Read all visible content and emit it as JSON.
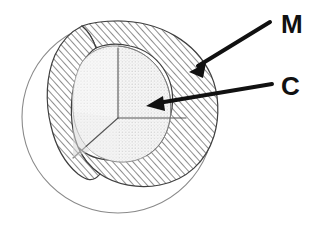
{
  "figure": {
    "type": "cutaway-cross-section",
    "background_color": "#ffffff",
    "canvas": {
      "width": 316,
      "height": 230
    }
  },
  "sphere": {
    "center": {
      "x": 118,
      "y": 117
    },
    "outer_radius": 96,
    "outline_color": "#8a8a8a",
    "outline_width": 1,
    "fill_color": "#ffffff"
  },
  "layers": [
    {
      "id": "mantle",
      "label": "M",
      "pattern": "diagonal-hatch",
      "pattern_color": "#3a3a3a",
      "fill_color": "#ffffff",
      "outer_radius": 96,
      "inner_radius": 66,
      "description": "outer hatched shell"
    },
    {
      "id": "core",
      "label": "C",
      "pattern": "fine-stipple-dots",
      "pattern_color": "#9a9a9a",
      "fill_color": "#f4f4f4",
      "radius": 66,
      "description": "inner stippled core"
    }
  ],
  "cutaway": {
    "description": "octant wedge removed to expose interior",
    "junction_point": {
      "x": 118,
      "y": 118
    },
    "edge_color": "#555555",
    "faces": [
      {
        "id": "vertical-cut-face",
        "from": {
          "x": 118,
          "y": 118
        },
        "to": {
          "x": 118,
          "y": 52
        }
      },
      {
        "id": "horizontal-cut-face",
        "from": {
          "x": 118,
          "y": 118
        },
        "to": {
          "x": 184,
          "y": 118
        }
      },
      {
        "id": "diagonal-cut-face",
        "from": {
          "x": 118,
          "y": 118
        },
        "to": {
          "x": 72,
          "y": 160
        }
      }
    ]
  },
  "annotations": [
    {
      "id": "mantle-callout",
      "label": "M",
      "meaning": "mantle",
      "label_position": {
        "x": 281,
        "y": 26
      },
      "arrow": {
        "tail": {
          "x": 270,
          "y": 22
        },
        "head": {
          "x": 191,
          "y": 71
        },
        "color": "#111111",
        "width": 4
      }
    },
    {
      "id": "core-callout",
      "label": "C",
      "meaning": "core",
      "label_position": {
        "x": 281,
        "y": 88
      },
      "arrow": {
        "tail": {
          "x": 272,
          "y": 84
        },
        "head": {
          "x": 147,
          "y": 106
        },
        "color": "#111111",
        "width": 4
      }
    }
  ],
  "colors": {
    "ink": "#111111",
    "hatch": "#3a3a3a",
    "stipple": "#9a9a9a",
    "outline": "#8a8a8a",
    "core_fill": "#f4f4f4",
    "paper": "#ffffff"
  }
}
